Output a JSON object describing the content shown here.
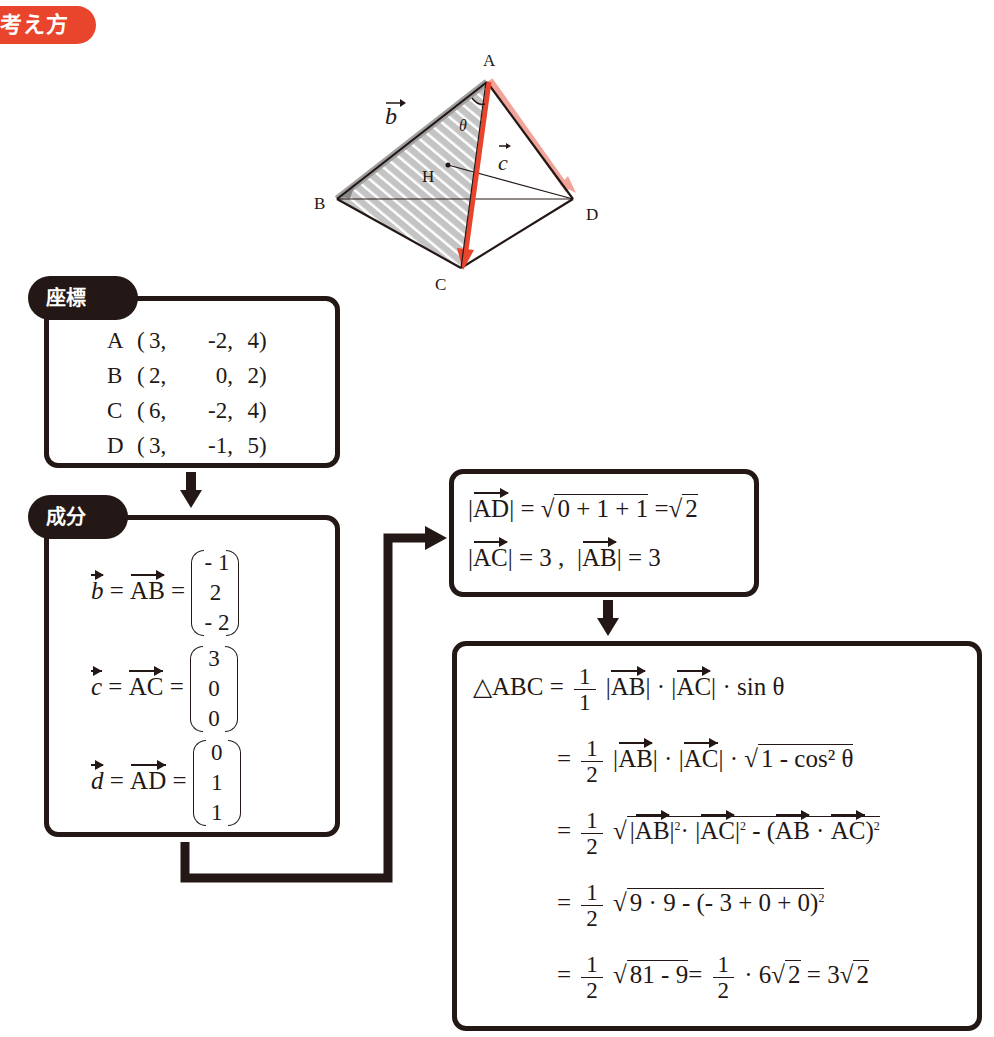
{
  "header": {
    "badge_label": "考え方",
    "badge_color": "#e8452c"
  },
  "figure": {
    "vertices": {
      "A": "A",
      "B": "B",
      "C": "C",
      "D": "D",
      "H": "H"
    },
    "labels": {
      "b_vec": "b",
      "c_vec": "c",
      "theta": "θ"
    },
    "accent_color": "#e8452c",
    "accent_light": "#f2a49a",
    "hatch_color": "#bfbfbf"
  },
  "coords_box": {
    "tag": "座標",
    "rows": [
      {
        "name": "A",
        "x": "3,",
        "y": "-2,",
        "z": "4"
      },
      {
        "name": "B",
        "x": "2,",
        "y": "0,",
        "z": "2"
      },
      {
        "name": "C",
        "x": "6,",
        "y": "-2,",
        "z": "4"
      },
      {
        "name": "D",
        "x": "3,",
        "y": "-1,",
        "z": "5"
      }
    ]
  },
  "components_box": {
    "tag": "成分",
    "rows": [
      {
        "lhs": "b",
        "vec": "AB",
        "eq": "=",
        "c1": "- 1",
        "c2": "2",
        "c3": "- 2"
      },
      {
        "lhs": "c",
        "vec": "AC",
        "eq": "=",
        "c1": "3",
        "c2": "0",
        "c3": "0"
      },
      {
        "lhs": "d",
        "vec": "AD",
        "eq": "=",
        "c1": "0",
        "c2": "1",
        "c3": "1"
      }
    ]
  },
  "magnitude_box": {
    "line1": {
      "vec": "AD",
      "eq": "=",
      "radicand": "0 + 1 + 1",
      "eq2": "=",
      "result": "2"
    },
    "line2": {
      "vec1": "AC",
      "val1": "= 3 ,",
      "vec2": "AB",
      "val2": "= 3"
    }
  },
  "area_box": {
    "lhs": "△ABC =",
    "line1": {
      "num": "1",
      "den": "1",
      "v1": "AB",
      "dot": "·",
      "v2": "AC",
      "tail": "· sin  θ"
    },
    "line2": {
      "eq": "=",
      "num": "1",
      "den": "2",
      "v1": "AB",
      "v2": "AC",
      "radicand": "1 -  cos² θ"
    },
    "line3": {
      "eq": "=",
      "num": "1",
      "den": "2",
      "v1": "AB",
      "v2": "AC",
      "minus": "-",
      "exp": "2"
    },
    "line4": {
      "eq": "=",
      "num": "1",
      "den": "2",
      "radicand": "9 · 9 -  (- 3 + 0 + 0)",
      "exp": "2"
    },
    "line5": {
      "eq": "=",
      "num": "1",
      "den": "2",
      "radicand": "81 - 9",
      "eq2": "=",
      "num2": "1",
      "den2": "2",
      "mid": "· 6",
      "r2": "2",
      "eq3": "= 3",
      "r3": "2"
    }
  }
}
